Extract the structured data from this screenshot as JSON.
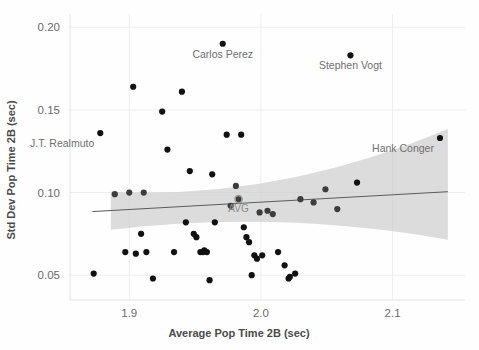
{
  "chart_data": {
    "type": "scatter",
    "title": "",
    "xlabel": "Average Pop Time 2B (sec)",
    "ylabel": "Std Dev Pop Time 2B (sec)",
    "xlim": [
      1.855,
      2.155
    ],
    "ylim": [
      0.035,
      0.208
    ],
    "xticks": [
      1.9,
      2.0,
      2.1
    ],
    "xtick_labels": [
      "1.9",
      "2.0",
      "2.1"
    ],
    "yticks": [
      0.05,
      0.1,
      0.15,
      0.2
    ],
    "ytick_labels": [
      "0.05",
      "0.10",
      "0.15",
      "0.20"
    ],
    "grid": "horizontal-and-vertical-light",
    "legend": "none",
    "points": [
      {
        "x": 1.873,
        "y": 0.051
      },
      {
        "x": 1.878,
        "y": 0.136,
        "label": "J.T. Realmuto",
        "label_pos": "below-left"
      },
      {
        "x": 1.889,
        "y": 0.099
      },
      {
        "x": 1.897,
        "y": 0.064
      },
      {
        "x": 1.9,
        "y": 0.1
      },
      {
        "x": 1.903,
        "y": 0.164
      },
      {
        "x": 1.905,
        "y": 0.063
      },
      {
        "x": 1.909,
        "y": 0.075
      },
      {
        "x": 1.911,
        "y": 0.1
      },
      {
        "x": 1.913,
        "y": 0.064
      },
      {
        "x": 1.918,
        "y": 0.048
      },
      {
        "x": 1.925,
        "y": 0.149
      },
      {
        "x": 1.929,
        "y": 0.126
      },
      {
        "x": 1.934,
        "y": 0.064
      },
      {
        "x": 1.94,
        "y": 0.161
      },
      {
        "x": 1.943,
        "y": 0.082
      },
      {
        "x": 1.946,
        "y": 0.113
      },
      {
        "x": 1.949,
        "y": 0.075
      },
      {
        "x": 1.951,
        "y": 0.073
      },
      {
        "x": 1.954,
        "y": 0.064
      },
      {
        "x": 1.956,
        "y": 0.064
      },
      {
        "x": 1.957,
        "y": 0.065
      },
      {
        "x": 1.959,
        "y": 0.064
      },
      {
        "x": 1.961,
        "y": 0.047
      },
      {
        "x": 1.963,
        "y": 0.111
      },
      {
        "x": 1.965,
        "y": 0.082
      },
      {
        "x": 1.971,
        "y": 0.19,
        "label": "Carlos Perez",
        "label_pos": "below"
      },
      {
        "x": 1.974,
        "y": 0.135
      },
      {
        "x": 1.977,
        "y": 0.092
      },
      {
        "x": 1.981,
        "y": 0.104
      },
      {
        "x": 1.983,
        "y": 0.096
      },
      {
        "x": 1.985,
        "y": 0.135
      },
      {
        "x": 1.987,
        "y": 0.079
      },
      {
        "x": 1.989,
        "y": 0.073
      },
      {
        "x": 1.991,
        "y": 0.07
      },
      {
        "x": 1.993,
        "y": 0.05
      },
      {
        "x": 1.995,
        "y": 0.062
      },
      {
        "x": 1.997,
        "y": 0.06
      },
      {
        "x": 1.999,
        "y": 0.088
      },
      {
        "x": 2.001,
        "y": 0.062
      },
      {
        "x": 2.005,
        "y": 0.089
      },
      {
        "x": 2.009,
        "y": 0.087
      },
      {
        "x": 2.013,
        "y": 0.064
      },
      {
        "x": 2.018,
        "y": 0.056
      },
      {
        "x": 2.021,
        "y": 0.048
      },
      {
        "x": 2.022,
        "y": 0.049
      },
      {
        "x": 2.026,
        "y": 0.051
      },
      {
        "x": 2.03,
        "y": 0.096
      },
      {
        "x": 2.04,
        "y": 0.094
      },
      {
        "x": 2.049,
        "y": 0.102
      },
      {
        "x": 2.058,
        "y": 0.09
      },
      {
        "x": 2.068,
        "y": 0.183,
        "label": "Stephen Vogt",
        "label_pos": "below"
      },
      {
        "x": 2.073,
        "y": 0.106
      },
      {
        "x": 2.136,
        "y": 0.133,
        "label": "Hank Conger",
        "label_pos": "below-left"
      }
    ],
    "average_marker": {
      "x": 1.983,
      "y": 0.096,
      "label": "AVG"
    },
    "trend_line": {
      "x_start": 1.872,
      "y_start": 0.0885,
      "x_end": 2.142,
      "y_end": 0.1005
    },
    "confidence_band": {
      "description": "shaded grey 95% confidence band widening at both ends",
      "x_start": 1.886,
      "x_end": 2.142,
      "upper_start": 0.1005,
      "lower_start": 0.0775,
      "upper_mid": 0.0955,
      "lower_mid": 0.0895,
      "upper_end": 0.1385,
      "lower_end": 0.0715
    }
  }
}
